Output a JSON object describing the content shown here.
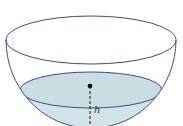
{
  "diagram": {
    "height_label": "h",
    "colors": {
      "outline": "#3f4a8a",
      "water_fill": "#d3e4e8",
      "water_surface": "#c6dbe0",
      "dashed_line": "#111111",
      "dot": "#000000"
    }
  }
}
